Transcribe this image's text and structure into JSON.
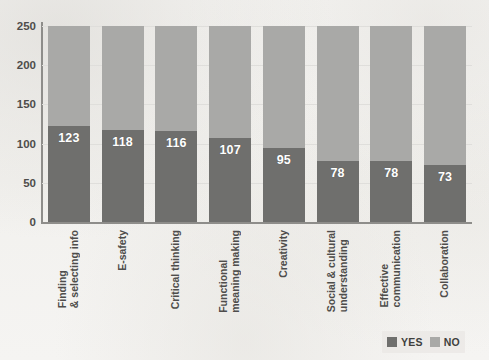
{
  "chart_data": {
    "type": "bar",
    "subtype": "stacked",
    "title": "",
    "xlabel": "",
    "ylabel": "",
    "ylim": [
      0,
      250
    ],
    "yticks": [
      0,
      50,
      100,
      150,
      200,
      250
    ],
    "grid": true,
    "legend_position": "bottom-right",
    "stack_total": 250,
    "categories": [
      "Finding\n& selecting info",
      "E-safety",
      "Critical thinking",
      "Functional\nmeaning making",
      "Creativity",
      "Social & cultural\nunderstanding",
      "Effective\ncommunication",
      "Collaboration"
    ],
    "series": [
      {
        "name": "YES",
        "color": "#6f6f6d",
        "values": [
          123,
          118,
          116,
          107,
          95,
          78,
          78,
          73
        ],
        "labels_shown": true
      },
      {
        "name": "NO",
        "color": "#a9a9a7",
        "values": [
          127,
          132,
          134,
          143,
          155,
          172,
          172,
          177
        ],
        "labels_shown": false
      }
    ]
  },
  "legend": {
    "items": [
      {
        "label": "YES",
        "color": "#6f6f6d"
      },
      {
        "label": "NO",
        "color": "#a9a9a7"
      }
    ]
  },
  "axis": {
    "y_tick_labels": [
      "250",
      "200",
      "150",
      "100",
      "50",
      "0"
    ]
  },
  "colors": {
    "background": "#f4f3f1",
    "axis": "#8e8d8a",
    "gridline": "#dfdedb",
    "text": "#4e4d4b",
    "value_text": "#ffffff"
  }
}
